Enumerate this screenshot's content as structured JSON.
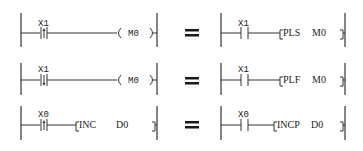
{
  "rows": [
    {
      "left": {
        "contact": "X1",
        "contact_type": "rising-edge",
        "coil": "M0",
        "output_type": "coil"
      },
      "equals": "=",
      "right": {
        "contact": "X1",
        "contact_type": "normally-open",
        "instruction": "PLS",
        "operand": "M0"
      }
    },
    {
      "left": {
        "contact": "X1",
        "contact_type": "falling-edge",
        "coil": "M0",
        "output_type": "coil"
      },
      "equals": "=",
      "right": {
        "contact": "X1",
        "contact_type": "normally-open",
        "instruction": "PLF",
        "operand": "M0"
      }
    },
    {
      "left": {
        "contact": "X0",
        "contact_type": "rising-edge",
        "instruction": "INC",
        "operand": "D0",
        "output_type": "instruction"
      },
      "equals": "=",
      "right": {
        "contact": "X0",
        "contact_type": "normally-open",
        "instruction": "INCP",
        "operand": "D0"
      }
    }
  ]
}
